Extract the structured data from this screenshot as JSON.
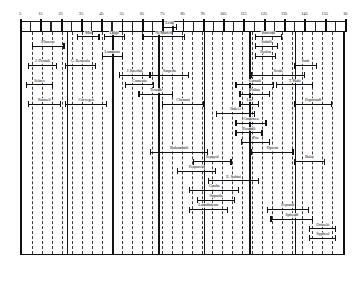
{
  "figure": {
    "type": "range-chart",
    "title": "",
    "background": "#ffffff",
    "ink_color": "#111111"
  },
  "axis": {
    "orientation": "horizontal-top",
    "label_every": 2,
    "tick_count": 33,
    "labels": [
      "5",
      "10",
      "15",
      "20",
      "25",
      "30",
      "35",
      "40",
      "45",
      "50",
      "55",
      "7",
      "65",
      "70",
      "75",
      "80",
      "85",
      "90",
      "95",
      "100",
      "105",
      "110",
      "115",
      "120",
      "125",
      "130",
      "135",
      "140",
      "145",
      "150",
      "155",
      "160",
      "10"
    ]
  },
  "frame": {
    "dashed_gridline_count": 32,
    "divider_positions_pct": [
      14.0,
      28.2,
      42.5,
      56.8,
      71.0,
      85.2
    ]
  },
  "chart_data": {
    "type": "bar",
    "orientation": "horizontal-range",
    "title": "",
    "xlabel": "",
    "ylabel": "",
    "xlim": [
      0,
      165
    ],
    "grid": true,
    "legend": "none",
    "bars": [
      {
        "label": "Pliocene",
        "x0": 5.0,
        "x1": 22.0,
        "row": 0
      },
      {
        "label": "Mio",
        "x0": 28.5,
        "x1": 40.0,
        "row": -1
      },
      {
        "label": "Oligo",
        "x0": 42.0,
        "x1": 53.0,
        "row": -1
      },
      {
        "label": "N. Marfeti",
        "x0": 62.0,
        "x1": 84.0,
        "row": -1
      },
      {
        "label": "Lenti",
        "x0": 72.0,
        "x1": 80.0,
        "row": -2
      },
      {
        "label": "Sarrentii",
        "x0": 120.0,
        "x1": 134.0,
        "row": -1
      },
      {
        "label": "Subtili",
        "x0": 120.0,
        "x1": 132.0,
        "row": 0
      },
      {
        "label": "Pyulus",
        "x0": 120.0,
        "x1": 131.0,
        "row": 1
      },
      {
        "label": "J. Dentali",
        "x0": 3.0,
        "x1": 18.0,
        "row": 2
      },
      {
        "label": "G. Benicula",
        "x0": 22.0,
        "x1": 38.0,
        "row": 2
      },
      {
        "label": "Lamensis",
        "x0": 41.0,
        "x1": 52.0,
        "row": 1
      },
      {
        "label": "J. Interlati",
        "x0": 50.0,
        "x1": 66.0,
        "row": 3
      },
      {
        "label": "Sarpeda",
        "x0": 66.0,
        "x1": 86.0,
        "row": 3
      },
      {
        "label": "Senki",
        "x0": 118.0,
        "x1": 146.0,
        "row": 3
      },
      {
        "label": "Sorti",
        "x0": 140.0,
        "x1": 152.0,
        "row": 2
      },
      {
        "label": "Sektes",
        "x0": 2.0,
        "x1": 16.0,
        "row": 4
      },
      {
        "label": "Camenia",
        "x0": 53.0,
        "x1": 68.0,
        "row": 4
      },
      {
        "label": "Tessalk",
        "x0": 60.0,
        "x1": 78.0,
        "row": 5
      },
      {
        "label": "Cornuli",
        "x0": 110.0,
        "x1": 130.0,
        "row": 4
      },
      {
        "label": "Palina",
        "x0": 112.0,
        "x1": 128.0,
        "row": 5
      },
      {
        "label": "T. Kuki",
        "x0": 131.0,
        "x1": 150.0,
        "row": 4
      },
      {
        "label": "Ruoneli",
        "x0": 3.0,
        "x1": 20.0,
        "row": 6
      },
      {
        "label": "Corvegea",
        "x0": 22.0,
        "x1": 44.0,
        "row": 6
      },
      {
        "label": "Chetami",
        "x0": 72.0,
        "x1": 94.0,
        "row": 6
      },
      {
        "label": "Lis",
        "x0": 112.0,
        "x1": 122.0,
        "row": 6
      },
      {
        "label": "Poporsudi",
        "x0": 140.0,
        "x1": 160.0,
        "row": 6
      },
      {
        "label": "Intlei.i",
        "x0": 100.0,
        "x1": 120.0,
        "row": 7
      },
      {
        "label": "Cmoenea",
        "x0": 110.0,
        "x1": 126.0,
        "row": 8
      },
      {
        "label": "Ecuptili",
        "x0": 110.0,
        "x1": 124.0,
        "row": 9
      },
      {
        "label": "Poe",
        "x0": 113.0,
        "x1": 128.0,
        "row": 10
      },
      {
        "label": "Rukombirli",
        "x0": 66.0,
        "x1": 96.0,
        "row": 11
      },
      {
        "label": "Dpersti",
        "x0": 118.0,
        "x1": 140.0,
        "row": 11
      },
      {
        "label": "Sepayul",
        "x0": 88.0,
        "x1": 108.0,
        "row": 12
      },
      {
        "label": "Bulai",
        "x0": 140.0,
        "x1": 156.0,
        "row": 12
      },
      {
        "label": "Pesporeki",
        "x0": 80.0,
        "x1": 100.0,
        "row": 13
      },
      {
        "label": "E. Subini",
        "x0": 96.0,
        "x1": 122.0,
        "row": 14
      },
      {
        "label": "Gunlia",
        "x0": 86.0,
        "x1": 112.0,
        "row": 15
      },
      {
        "label": "Soparila",
        "x0": 90.0,
        "x1": 110.0,
        "row": 16
      },
      {
        "label": "Lomdinterm",
        "x0": 86.0,
        "x1": 106.0,
        "row": 17
      },
      {
        "label": "Pepundi",
        "x0": 126.0,
        "x1": 148.0,
        "row": 17
      },
      {
        "label": "Spheudi",
        "x0": 128.0,
        "x1": 150.0,
        "row": 18
      },
      {
        "label": "Orisseki",
        "x0": 148.0,
        "x1": 162.0,
        "row": 19
      },
      {
        "label": "Sypheul",
        "x0": 148.0,
        "x1": 162.0,
        "row": 20
      }
    ]
  }
}
